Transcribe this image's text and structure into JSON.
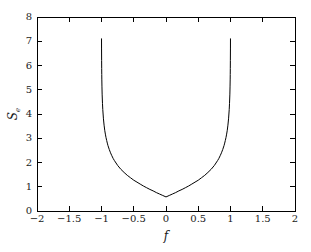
{
  "chart_data": {
    "type": "line",
    "title": "",
    "subtitle": "",
    "xlabel": "f",
    "ylabel": "S",
    "ylabel_sub": "e",
    "ylabel_full": "S_e",
    "xlim": [
      -2,
      2
    ],
    "ylim": [
      0,
      8
    ],
    "xticks": [
      -2,
      -1.5,
      -1,
      -0.5,
      0,
      0.5,
      1,
      1.5,
      2
    ],
    "xtick_labels": [
      "−2",
      "−1.5",
      "−1",
      "−0.5",
      "0",
      "0.5",
      "1",
      "1.5",
      "2"
    ],
    "yticks": [
      0,
      1,
      2,
      3,
      4,
      5,
      6,
      7,
      8
    ],
    "ytick_labels": [
      "0",
      "1",
      "2",
      "3",
      "4",
      "5",
      "6",
      "7",
      "8"
    ],
    "grid": false,
    "legend": null,
    "legend_position": "none",
    "line_color": "#000000",
    "line_width": 1,
    "axes_color": "#000000",
    "background_color": "#ffffff",
    "annotations": [],
    "domain": [
      -1,
      1
    ],
    "minimum": {
      "x": 0,
      "y": 0.32
    },
    "curve_top_value": 7.1,
    "asymptotes": [
      -1,
      1
    ],
    "series": [
      {
        "name": "S_e(f)",
        "x": [
          -0.9995,
          -0.999,
          -0.998,
          -0.997,
          -0.996,
          -0.995,
          -0.993,
          -0.99,
          -0.985,
          -0.98,
          -0.97,
          -0.96,
          -0.95,
          -0.94,
          -0.93,
          -0.92,
          -0.91,
          -0.9,
          -0.88,
          -0.86,
          -0.84,
          -0.82,
          -0.8,
          -0.75,
          -0.7,
          -0.65,
          -0.6,
          -0.55,
          -0.5,
          -0.45,
          -0.4,
          -0.35,
          -0.3,
          -0.25,
          -0.2,
          -0.15,
          -0.1,
          -0.05,
          0,
          0.05,
          0.1,
          0.15,
          0.2,
          0.25,
          0.3,
          0.35,
          0.4,
          0.45,
          0.5,
          0.55,
          0.6,
          0.65,
          0.7,
          0.75,
          0.8,
          0.82,
          0.84,
          0.86,
          0.88,
          0.9,
          0.91,
          0.92,
          0.93,
          0.94,
          0.95,
          0.96,
          0.97,
          0.98,
          0.985,
          0.99,
          0.993,
          0.995,
          0.996,
          0.997,
          0.998,
          0.999,
          0.9995
        ],
        "y": [
          7.1,
          6.72,
          6.2,
          5.87,
          5.63,
          5.44,
          5.15,
          4.82,
          4.44,
          4.18,
          3.8,
          3.54,
          3.33,
          3.17,
          3.03,
          2.91,
          2.8,
          2.7,
          2.54,
          2.4,
          2.28,
          2.17,
          2.08,
          1.88,
          1.72,
          1.59,
          1.47,
          1.37,
          1.27,
          1.19,
          1.11,
          1.03,
          0.96,
          0.89,
          0.83,
          0.76,
          0.7,
          0.64,
          0.58,
          0.64,
          0.7,
          0.76,
          0.83,
          0.89,
          0.96,
          1.03,
          1.11,
          1.19,
          1.27,
          1.37,
          1.47,
          1.59,
          1.72,
          1.88,
          2.08,
          2.17,
          2.28,
          2.4,
          2.54,
          2.7,
          2.8,
          2.91,
          3.03,
          3.17,
          3.33,
          3.54,
          3.8,
          4.18,
          4.44,
          4.82,
          5.15,
          5.44,
          5.63,
          5.87,
          6.2,
          6.72,
          7.1
        ]
      }
    ]
  },
  "figure": {
    "plot_area": {
      "left": 37,
      "top": 17,
      "right": 295,
      "bottom": 211
    }
  }
}
